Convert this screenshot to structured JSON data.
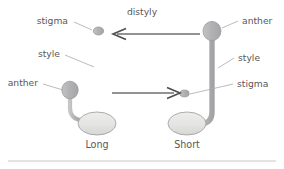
{
  "figure": {
    "title_text": "distyly",
    "background_color": "#ffffff",
    "width": 284,
    "height": 169
  },
  "colors": {
    "text": "#58585a",
    "leader_line": "#a9a9ac",
    "arrow": "#6f6f72",
    "arrow_head": "#4e4e51",
    "organ_fill_dark": "#b6b6b8",
    "organ_fill_light": "#e3e3e1",
    "organ_outline": "#9a9a9d",
    "rule": "#c8c8cb"
  },
  "labels": {
    "distyly": "distyly",
    "left_stigma": "stigma",
    "left_style": "style",
    "left_anther": "anther",
    "right_anther": "anther",
    "right_style": "style",
    "right_stigma": "stigma",
    "left_morph": "Long",
    "right_morph": "Short"
  },
  "morphs": [
    {
      "name": "Long",
      "caption": "Long",
      "parts": [
        {
          "name": "stigma",
          "position": "top",
          "height_rank": "high"
        },
        {
          "name": "style",
          "position": "central",
          "length": "long"
        },
        {
          "name": "anther",
          "position": "lower-left",
          "height_rank": "low"
        },
        {
          "name": "ovary",
          "position": "base"
        }
      ]
    },
    {
      "name": "Short",
      "caption": "Short",
      "parts": [
        {
          "name": "anther",
          "position": "top",
          "height_rank": "high"
        },
        {
          "name": "style",
          "position": "right",
          "length": "filament-long"
        },
        {
          "name": "stigma",
          "position": "lower-center",
          "height_rank": "low"
        },
        {
          "name": "ovary",
          "position": "base"
        }
      ]
    }
  ],
  "arrows": [
    {
      "name": "pollen-transfer-short-to-long",
      "direction": "left",
      "label": "distyly"
    },
    {
      "name": "pollen-transfer-long-to-short",
      "direction": "right",
      "label": ""
    }
  ]
}
